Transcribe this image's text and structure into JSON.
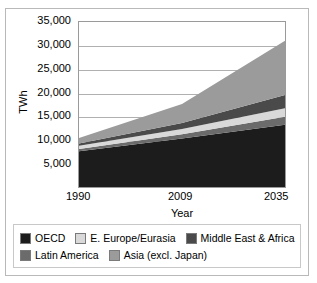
{
  "figure": {
    "title_remnant": "",
    "background": "#ffffff",
    "frame_color": "#b9b9b9"
  },
  "chart_data": {
    "type": "area",
    "title": "",
    "subtitle": "",
    "xlabel": "Year",
    "ylabel": "TWh",
    "x": [
      1990,
      2009,
      2035
    ],
    "xtick_labels": [
      "1990",
      "2009",
      "2035"
    ],
    "ytick_labels": [
      "35,000",
      "30,000",
      "25,000",
      "20,000",
      "15,000",
      "10,000",
      "5,000"
    ],
    "ytick_values": [
      35000,
      30000,
      25000,
      20000,
      15000,
      10000,
      5000
    ],
    "ylim": [
      0,
      35000
    ],
    "xlim": [
      1990,
      2035
    ],
    "grid": true,
    "stacked": true,
    "legend_position": "bottom",
    "series": [
      {
        "name": "OECD",
        "color": "#1c1c1c",
        "values": [
          7600,
          10300,
          13200
        ]
      },
      {
        "name": "Latin America",
        "color": "#6b6b6b",
        "values": [
          450,
          900,
          1700
        ]
      },
      {
        "name": "E. Europe/Eurasia",
        "color": "#d9d9d9",
        "values": [
          700,
          1100,
          1800
        ]
      },
      {
        "name": "Middle East & Africa",
        "color": "#4a4a4a",
        "values": [
          500,
          1250,
          2800
        ]
      },
      {
        "name": "Asia (excl. Japan)",
        "color": "#9b9b9b",
        "values": [
          1150,
          4050,
          11500
        ]
      }
    ],
    "totals": [
      10400,
      17600,
      31000
    ],
    "annotations": []
  },
  "legend": {
    "rows": [
      [
        {
          "label": "OECD",
          "color": "#1c1c1c"
        },
        {
          "label": "E. Europe/Eurasia",
          "color": "#d9d9d9"
        },
        {
          "label": "Middle East & Africa",
          "color": "#4a4a4a"
        }
      ],
      [
        {
          "label": "Latin America",
          "color": "#6b6b6b"
        },
        {
          "label": "Asia (excl. Japan)",
          "color": "#9b9b9b"
        }
      ]
    ]
  }
}
